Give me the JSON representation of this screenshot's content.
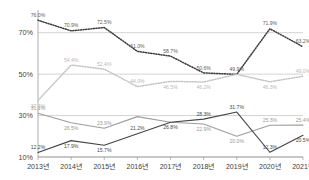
{
  "chart_data": {
    "type": "line",
    "title": "",
    "xlabel": "",
    "ylabel": "",
    "ylim": [
      10,
      80
    ],
    "yticks": [
      10,
      30,
      50,
      70
    ],
    "ytick_labels": [
      "10%",
      "30%",
      "50%",
      "70%"
    ],
    "grid": true,
    "legend_position": "none",
    "categories": [
      "2013년",
      "2014년",
      "2015년",
      "2016년",
      "2017년",
      "2018년",
      "2019년",
      "2020년",
      "2021년"
    ],
    "series": [
      {
        "name": "series-1",
        "style": "dotted",
        "color": "#3b3b3b",
        "values": [
          76.0,
          70.9,
          72.5,
          61.0,
          58.7,
          50.6,
          49.9,
          71.9,
          63.2
        ],
        "labels": [
          "76.0%",
          "70.9%",
          "72.5%",
          "61.0%",
          "58.7%",
          "50.6%",
          "49.9%",
          "71.9%",
          "63.2%"
        ],
        "label_side": [
          "above",
          "above",
          "above",
          "above",
          "above",
          "above",
          "above",
          "above",
          "above"
        ]
      },
      {
        "name": "series-2",
        "style": "dotted",
        "color": "#c4c4c4",
        "values": [
          37.3,
          54.4,
          52.4,
          44.0,
          46.5,
          46.2,
          49.9,
          46.3,
          49.0
        ],
        "labels": [
          "37.3%",
          "54.4%",
          "52.4%",
          "44.0%",
          "46.5%",
          "46.2%",
          "",
          "46.3%",
          "49.0%"
        ],
        "label_side": [
          "below",
          "above",
          "above",
          "above",
          "below",
          "below",
          "above",
          "below",
          "above"
        ]
      },
      {
        "name": "series-3",
        "style": "solid",
        "color": "#9d9d9d",
        "values": [
          31.1,
          26.5,
          23.9,
          29.5,
          26.8,
          25.9,
          20.0,
          25.3,
          25.4
        ],
        "labels": [
          "31.1%",
          "26.5%",
          "23.9%",
          "",
          "",
          "22.9%",
          "20.0%",
          "25.3%",
          "25.4%"
        ],
        "label_side": [
          "above",
          "below",
          "above",
          "above",
          "below",
          "below",
          "below",
          "above",
          "above"
        ]
      },
      {
        "name": "series-4",
        "style": "solid",
        "color": "#444444",
        "values": [
          12.2,
          17.9,
          15.7,
          21.2,
          26.8,
          28.3,
          31.7,
          12.3,
          20.5
        ],
        "labels": [
          "12.2%",
          "17.9%",
          "15.7%",
          "21.2%",
          "26.8%",
          "28.3%",
          "31.7%",
          "12.3%",
          "20.5%"
        ],
        "label_side": [
          "above",
          "below",
          "below",
          "above",
          "below",
          "above",
          "above",
          "above",
          "below"
        ]
      }
    ]
  },
  "axis": {
    "y_label_0": "10%",
    "y_label_1": "30%",
    "y_label_2": "50%",
    "y_label_3": "70%"
  },
  "colors": {
    "gridline": "#b6b6b6",
    "axis": "#8d8d8d",
    "background": "#ffffff"
  }
}
